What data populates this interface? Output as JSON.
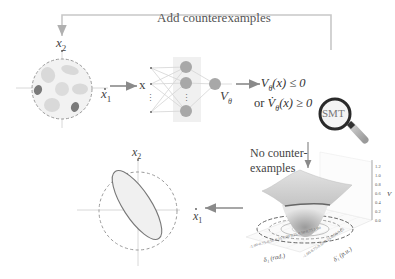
{
  "feedback_loop": {
    "label": "Add counterexamples"
  },
  "sample_space": {
    "axis_x_label": "x",
    "axis_x_sub": "1",
    "axis_y_label": "x",
    "axis_y_sub": "2"
  },
  "network": {
    "input_label": "x",
    "output_label": "V",
    "output_sub": "θ"
  },
  "condition": {
    "line1": "V",
    "line1_sub": "θ",
    "line1_rest": "(x) ≤ 0",
    "line2_prefix": "or ",
    "line2": "V̇",
    "line2_sub": "θ",
    "line2_rest": "(x) ≥ 0"
  },
  "verifier": {
    "label": "SMT"
  },
  "result": {
    "line1": "No counter-",
    "line2": "examples"
  },
  "surface_plot": {
    "z_label": "V",
    "z_ticks": [
      "0.0",
      "0.2",
      "0.4",
      "0.6",
      "0.8",
      "1.0",
      "1.2"
    ],
    "x_label": "δ₁ (rad.)",
    "y_label": "δ̇₁ (p.u.)",
    "x_ticks": [
      "-1.00",
      "-0.75",
      "-0.50",
      "-0.25",
      "0.00",
      "0.25",
      "0.50",
      "0.75",
      "1.00"
    ],
    "y_ticks": [
      "-1.00",
      "-0.75",
      "-0.50",
      "-0.25",
      "0.00",
      "0.25",
      "0.50",
      "0.75",
      "1.00"
    ]
  },
  "final_roa": {
    "axis_x_label": "x",
    "axis_x_sub": "1",
    "axis_y_label": "x",
    "axis_y_sub": "2"
  },
  "colors": {
    "arrow": "#8a8a8a",
    "feedback_line": "#c8c8c8",
    "neuron": "#a8a8a8",
    "sample_dark": "#7a7a7a",
    "sample_light": "#d8d8d8",
    "dashed_circle": "#9a9a9a",
    "ellipse": "#777777"
  }
}
